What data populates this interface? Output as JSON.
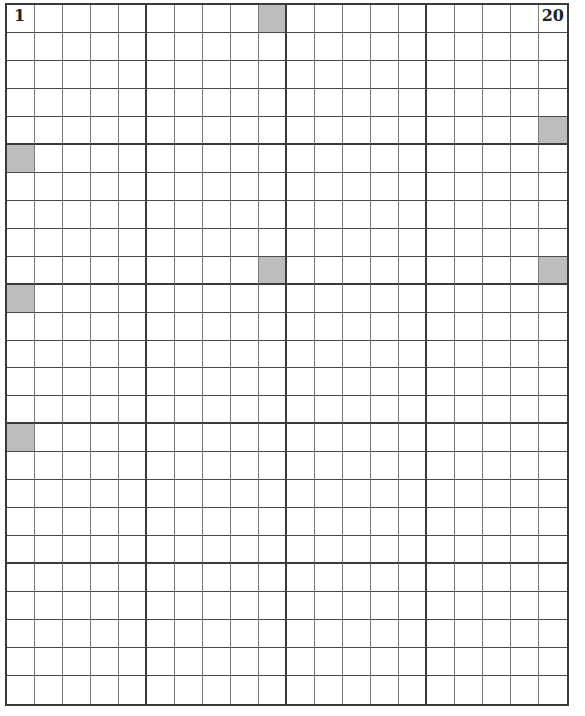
{
  "grid": {
    "columns": 20,
    "rows": 25,
    "block_size": 5,
    "start_label": "1",
    "end_label": "20",
    "shaded_color": "#bdbdbd",
    "line_color": "#3a3a3a",
    "shaded_cells": [
      {
        "row": 1,
        "col": 10
      },
      {
        "row": 5,
        "col": 20
      },
      {
        "row": 6,
        "col": 1
      },
      {
        "row": 10,
        "col": 10
      },
      {
        "row": 10,
        "col": 20
      },
      {
        "row": 11,
        "col": 1
      },
      {
        "row": 16,
        "col": 1
      }
    ]
  }
}
